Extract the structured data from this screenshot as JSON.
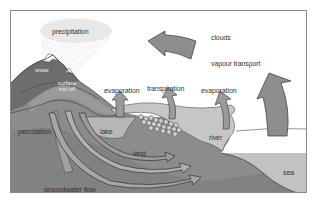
{
  "diagram": {
    "labels": {
      "precipitation": "precipitation",
      "clouds": "clouds",
      "vapour_transport": "vapour transport",
      "snow": "snow",
      "surface_run_off": "surface run off",
      "evaporation_lake": "evaporation",
      "transpiration": "transpiration",
      "evaporation_river": "evaporation",
      "percolation": "percolation",
      "lake": "lake",
      "land": "land",
      "river": "river",
      "sea": "sea",
      "groundwater_flow": "groundwater flow"
    },
    "arrows": [
      {
        "name": "cloud-transport-arrow",
        "direction": "left"
      },
      {
        "name": "sea-evaporation-arrow",
        "direction": "up"
      },
      {
        "name": "lake-evaporation-arrow",
        "direction": "up"
      },
      {
        "name": "transpiration-arrow",
        "direction": "up"
      },
      {
        "name": "river-evaporation-arrow",
        "direction": "up"
      },
      {
        "name": "groundwater-arrows",
        "direction": "right"
      }
    ],
    "colors": {
      "ground_dark": "#6f6f6f",
      "ground_mid": "#8c8c8c",
      "ground_light": "#a8a8a8",
      "water": "#b9b9b9",
      "sea": "#c3c3c3",
      "arrow": "#8e8e8e",
      "rain": "#d8d8d8",
      "frame": "#8a8a8a"
    }
  }
}
